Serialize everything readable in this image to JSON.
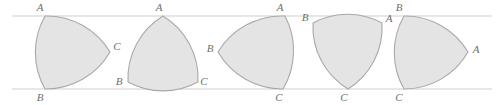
{
  "figure": {
    "width": 504,
    "height": 105,
    "background_color": "#ffffff",
    "fill_color": "#e4e4e4",
    "stroke_color": "#a9a9a9",
    "label_color": "#6f6f6f",
    "rail_color": "#cfcfcf",
    "rails": {
      "top_y": 16,
      "bottom_y": 89,
      "x_start": 12,
      "x_end": 492
    },
    "shape_count": 5,
    "shapes": [
      {
        "index": 1,
        "name": "reuleaux-position-1",
        "vertices": [
          {
            "label": "A",
            "x": 45,
            "y": 16,
            "label_x": 40,
            "label_y": 8
          },
          {
            "label": "B",
            "x": 45,
            "y": 89,
            "label_x": 40,
            "label_y": 98
          },
          {
            "label": "C",
            "x": 110,
            "y": 52,
            "label_x": 117,
            "label_y": 47
          }
        ]
      },
      {
        "index": 2,
        "name": "reuleaux-position-2",
        "vertices": [
          {
            "label": "A",
            "x": 163,
            "y": 16,
            "label_x": 159,
            "label_y": 8
          },
          {
            "label": "B",
            "x": 128,
            "y": 82,
            "label_x": 119,
            "label_y": 82
          },
          {
            "label": "C",
            "x": 198,
            "y": 82,
            "label_x": 204,
            "label_y": 82
          }
        ]
      },
      {
        "index": 3,
        "name": "reuleaux-position-3",
        "vertices": [
          {
            "label": "A",
            "x": 285,
            "y": 16,
            "label_x": 280,
            "label_y": 8
          },
          {
            "label": "B",
            "x": 218,
            "y": 52,
            "label_x": 210,
            "label_y": 49
          },
          {
            "label": "C",
            "x": 283,
            "y": 89,
            "label_x": 279,
            "label_y": 98
          }
        ]
      },
      {
        "index": 4,
        "name": "reuleaux-position-4",
        "vertices": [
          {
            "label": "B",
            "x": 313,
            "y": 23,
            "label_x": 305,
            "label_y": 18
          },
          {
            "label": "A",
            "x": 382,
            "y": 23,
            "label_x": 389,
            "label_y": 19
          },
          {
            "label": "C",
            "x": 348,
            "y": 89,
            "label_x": 344,
            "label_y": 98
          }
        ]
      },
      {
        "index": 5,
        "name": "reuleaux-position-5",
        "vertices": [
          {
            "label": "B",
            "x": 404,
            "y": 16,
            "label_x": 399,
            "label_y": 8
          },
          {
            "label": "C",
            "x": 404,
            "y": 89,
            "label_x": 399,
            "label_y": 98
          },
          {
            "label": "A",
            "x": 468,
            "y": 52,
            "label_x": 476,
            "label_y": 50
          }
        ]
      }
    ]
  }
}
